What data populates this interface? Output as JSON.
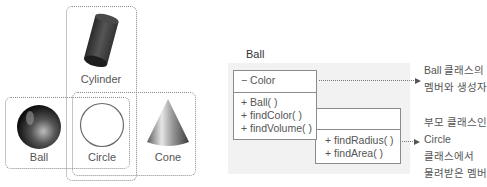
{
  "shapes": {
    "cylinder": {
      "label": "Cylinder"
    },
    "ball": {
      "label": "Ball"
    },
    "circle": {
      "label": "Circle"
    },
    "cone": {
      "label": "Cone"
    }
  },
  "uml": {
    "title": "Ball",
    "ball_class": {
      "attributes": [
        "− Color"
      ],
      "methods": [
        "+ Ball( )",
        "+ findColor( )",
        "+ findVolume( )"
      ]
    },
    "circle_class": {
      "attributes": [],
      "methods": [
        "+ findRadius( )",
        "+ findArea( )"
      ]
    }
  },
  "annotations": {
    "own_members": [
      "Ball 클래스의",
      "멤버와 생성자"
    ],
    "inherited_members": [
      "부모 클래스인",
      "Circle",
      "클래스에서",
      "물려받은 멤버"
    ]
  },
  "colors": {
    "panel_bg": "#f2f2f2",
    "border": "#8c8c8c",
    "dotted": "#8a8a8a"
  }
}
